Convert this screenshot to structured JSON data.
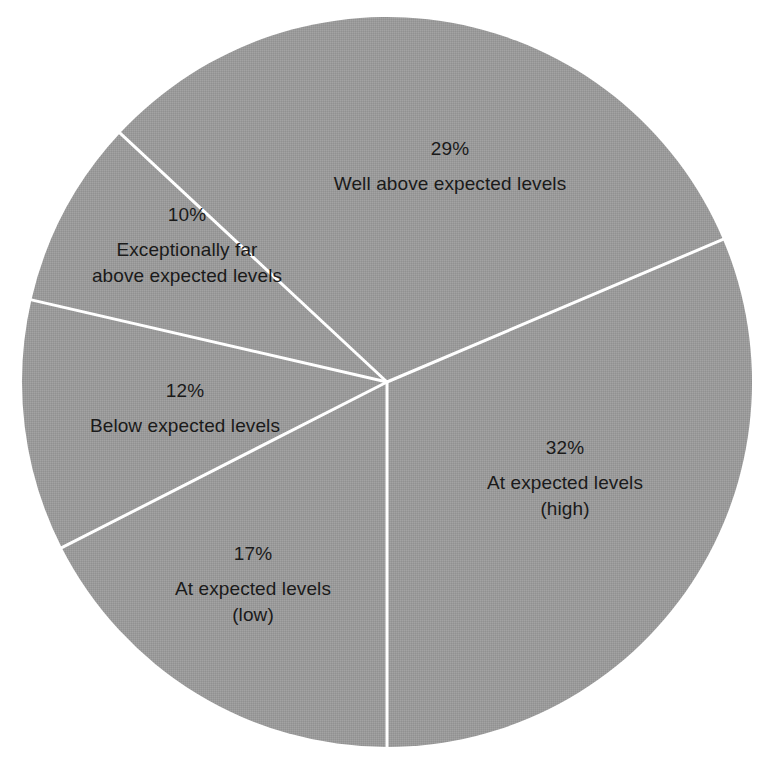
{
  "chart_data": {
    "type": "pie",
    "title": "",
    "subtitle": "",
    "xlabel": "",
    "ylabel": "",
    "legend_position": "none",
    "grid": false,
    "fill_color": "#9a9a9a",
    "divider_color": "#ffffff",
    "text_color": "#1a1a1a",
    "background_color": "#ffffff",
    "total": 100,
    "units": "%",
    "categories": [
      "At expected levels (high)",
      "At expected levels (low)",
      "Below expected levels",
      "Exceptionally far above expected levels",
      "Well above expected levels"
    ],
    "values": [
      32,
      17,
      12,
      10,
      29
    ],
    "slices": [
      {
        "id": "at-expected-high",
        "percent_label": "32%",
        "value": 32,
        "label_lines": [
          "At expected levels",
          "(high)"
        ],
        "start_angle_deg": 337,
        "end_angle_deg": 90,
        "label_x": 565,
        "label_y": 478
      },
      {
        "id": "at-expected-low",
        "percent_label": "17%",
        "value": 17,
        "label_lines": [
          "At expected levels",
          "(low)"
        ],
        "start_angle_deg": 90,
        "end_angle_deg": 153,
        "label_x": 253,
        "label_y": 584
      },
      {
        "id": "below-expected",
        "percent_label": "12%",
        "value": 12,
        "label_lines": [
          "Below expected levels"
        ],
        "start_angle_deg": 153,
        "end_angle_deg": 193,
        "label_x": 185,
        "label_y": 408
      },
      {
        "id": "exceptionally-far-above",
        "percent_label": "10%",
        "value": 10,
        "label_lines": [
          "Exceptionally far",
          "above expected levels"
        ],
        "start_angle_deg": 193,
        "end_angle_deg": 223,
        "label_x": 187,
        "label_y": 245
      },
      {
        "id": "well-above-expected",
        "percent_label": "29%",
        "value": 29,
        "label_lines": [
          "Well above expected levels"
        ],
        "start_angle_deg": 223,
        "end_angle_deg": 337,
        "label_x": 450,
        "label_y": 166
      }
    ],
    "geometry": {
      "center_x": 387,
      "center_y": 382,
      "radius": 365
    }
  }
}
